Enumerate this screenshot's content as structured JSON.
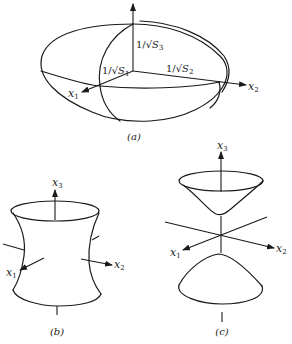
{
  "figure": {
    "panels": [
      {
        "id": "a",
        "caption": "(a)",
        "shape": "ellipsoid",
        "axes": {
          "x1": {
            "name": "x",
            "sub": "1"
          },
          "x2": {
            "name": "x",
            "sub": "2"
          },
          "x3": {
            "name": "x",
            "sub": "3"
          }
        },
        "semi_axis_labels": {
          "s1": {
            "prefix": "1/√",
            "var": "S",
            "sub": "1"
          },
          "s2": {
            "prefix": "1/√",
            "var": "S",
            "sub": "2"
          },
          "s3": {
            "prefix": "1/√",
            "var": "S",
            "sub": "3"
          }
        }
      },
      {
        "id": "b",
        "caption": "(b)",
        "shape": "hyperboloid-of-one-sheet",
        "axes": {
          "x1": {
            "name": "x",
            "sub": "1"
          },
          "x2": {
            "name": "x",
            "sub": "2"
          },
          "x3": {
            "name": "x",
            "sub": "3"
          }
        }
      },
      {
        "id": "c",
        "caption": "(c)",
        "shape": "hyperboloid-of-two-sheets",
        "axes": {
          "x1": {
            "name": "x",
            "sub": "1"
          },
          "x2": {
            "name": "x",
            "sub": "2"
          },
          "x3": {
            "name": "x",
            "sub": "3"
          }
        }
      }
    ]
  }
}
